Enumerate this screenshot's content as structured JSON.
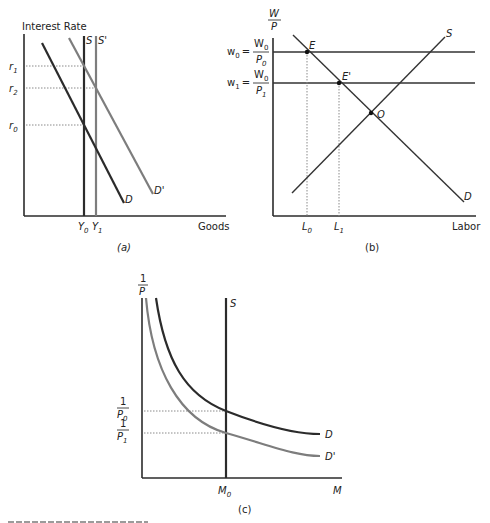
{
  "figure": {
    "panels": [
      {
        "id": "a",
        "caption": "(a)",
        "y_axis_label": "Interest Rate",
        "x_axis_label": "Goods",
        "y_ticks": [
          "r1",
          "r2",
          "r0"
        ],
        "x_ticks": [
          "Y0",
          "Y1"
        ],
        "curves": [
          "S",
          "S'",
          "D",
          "D'"
        ]
      },
      {
        "id": "b",
        "caption": "(b)",
        "y_axis_label": "W/P",
        "x_axis_label": "Labor",
        "y_ticks": [
          "w0 = W0/P0",
          "w1 = W0/P1"
        ],
        "x_ticks": [
          "L0",
          "L1"
        ],
        "curves": [
          "S",
          "D"
        ],
        "points": [
          "E",
          "E'",
          "O"
        ]
      },
      {
        "id": "c",
        "caption": "(c)",
        "y_axis_label": "1/P",
        "x_axis_label": "M",
        "y_ticks": [
          "1/P0",
          "1/P1"
        ],
        "x_ticks": [
          "M0"
        ],
        "curves": [
          "S",
          "D",
          "D'"
        ]
      }
    ]
  },
  "labels": {
    "a": {
      "ylabel": "Interest Rate",
      "xlabel": "Goods",
      "caption": "(a)",
      "r1": "r",
      "r1_sub": "1",
      "r2": "r",
      "r2_sub": "2",
      "r0": "r",
      "r0_sub": "0",
      "Y0": "Y",
      "Y0_sub": "0",
      "Y1": "Y",
      "Y1_sub": "1",
      "S": "S",
      "S_prime": "S'",
      "D": "D",
      "D_prime": "D'"
    },
    "b": {
      "ylabel_num": "W",
      "ylabel_den": "P",
      "xlabel": "Labor",
      "caption": "(b)",
      "w0": "w",
      "w0_sub": "0",
      "w1": "w",
      "w1_sub": "1",
      "eq": "=",
      "W0_num": "W",
      "W0_num_sub": "0",
      "P0_den": "P",
      "P0_den_sub": "0",
      "W0_num2": "W",
      "W0_num2_sub": "0",
      "P1_den": "P",
      "P1_den_sub": "1",
      "L0": "L",
      "L0_sub": "0",
      "L1": "L",
      "L1_sub": "1",
      "S": "S",
      "D": "D",
      "E": "E",
      "E_prime": "E'",
      "O": "O"
    },
    "c": {
      "ylabel_num": "1",
      "ylabel_den": "P",
      "xlabel": "M",
      "caption": "(c)",
      "inv_P0_num": "1",
      "inv_P0_den": "P",
      "inv_P0_sub": "0",
      "inv_P1_num": "1",
      "inv_P1_den": "P",
      "inv_P1_sub": "1",
      "M0": "M",
      "M0_sub": "0",
      "S": "S",
      "D": "D",
      "D_prime": "D'"
    }
  },
  "colors": {
    "dark_line": "#2b2b2b",
    "gray_line": "#7a7a7a",
    "dotted": "#8a8a8a",
    "background": "#ffffff"
  }
}
